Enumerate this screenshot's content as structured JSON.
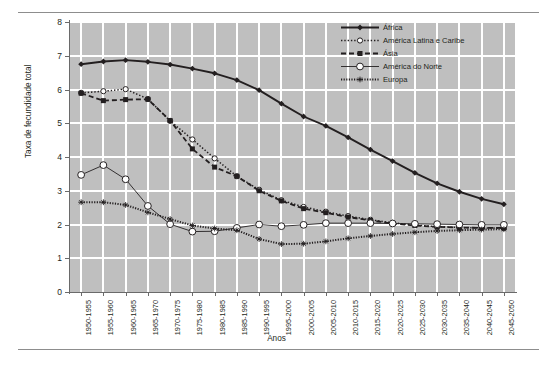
{
  "chart_data": {
    "type": "line",
    "title": "",
    "xlabel": "Anos",
    "ylabel": "Taxa de fecundidade total",
    "ylim": [
      0,
      8
    ],
    "yticks": [
      0,
      1,
      2,
      3,
      4,
      5,
      6,
      7,
      8
    ],
    "grid": true,
    "legend_position": "top-right",
    "plot_background": "#bfbfbf",
    "gridline_color": "#ffffff",
    "categories": [
      "1950-1955",
      "1955-1960",
      "1960-1965",
      "1965-1970",
      "1970-1975",
      "1975-1980",
      "1980-1985",
      "1985-1990",
      "1990-1995",
      "1995-2000",
      "2000-2005",
      "2005-2010",
      "2010-2015",
      "2015-2020",
      "2020-2025",
      "2025-2030",
      "2030-2035",
      "2035-2040",
      "2040-2045",
      "2045-2050"
    ],
    "series": [
      {
        "name": "África",
        "color": "#231f20",
        "line_style": "solid",
        "marker": "diamond-filled",
        "values": [
          6.75,
          6.83,
          6.87,
          6.82,
          6.74,
          6.62,
          6.48,
          6.28,
          5.98,
          5.58,
          5.2,
          4.92,
          4.58,
          4.22,
          3.88,
          3.53,
          3.22,
          2.97,
          2.76,
          2.6
        ]
      },
      {
        "name": "América Latina e Caribe",
        "color": "#231f20",
        "line_style": "dotted",
        "marker": "circle-open",
        "values": [
          5.9,
          5.95,
          6.01,
          5.72,
          5.07,
          4.52,
          3.96,
          3.43,
          3.03,
          2.72,
          2.52,
          2.38,
          2.25,
          2.14,
          2.05,
          1.98,
          1.94,
          1.91,
          1.9,
          1.9
        ]
      },
      {
        "name": "Ásia",
        "color": "#231f20",
        "line_style": "dashed",
        "marker": "square-filled",
        "values": [
          5.89,
          5.67,
          5.7,
          5.71,
          5.08,
          4.24,
          3.7,
          3.43,
          3.0,
          2.7,
          2.47,
          2.35,
          2.22,
          2.12,
          2.03,
          1.97,
          1.93,
          1.91,
          1.9,
          1.9
        ]
      },
      {
        "name": "América do Norte",
        "color": "#231f20",
        "line_style": "solid-thin",
        "marker": "circle-open-large",
        "values": [
          3.47,
          3.76,
          3.34,
          2.55,
          2.01,
          1.79,
          1.8,
          1.9,
          2.0,
          1.95,
          1.99,
          2.04,
          2.04,
          2.04,
          2.03,
          2.02,
          2.01,
          2.0,
          1.99,
          1.99
        ]
      },
      {
        "name": "Europa",
        "color": "#231f20",
        "line_style": "dotted-heavy",
        "marker": "star",
        "values": [
          2.66,
          2.66,
          2.58,
          2.36,
          2.16,
          1.97,
          1.88,
          1.83,
          1.57,
          1.42,
          1.43,
          1.5,
          1.59,
          1.66,
          1.72,
          1.77,
          1.81,
          1.83,
          1.85,
          1.86
        ]
      }
    ]
  },
  "legend": {
    "entries": [
      {
        "label": "África"
      },
      {
        "label": "América Latina e Caribe"
      },
      {
        "label": "Ásia"
      },
      {
        "label": "América do Norte"
      },
      {
        "label": "Europa"
      }
    ]
  }
}
